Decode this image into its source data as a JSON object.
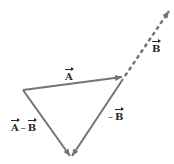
{
  "diagram": {
    "colors": {
      "line": "#737373",
      "label": "#2a2a2a",
      "background": "#ffffff"
    },
    "vectors": [
      {
        "name": "A",
        "style": "solid",
        "from": [
          23,
          90
        ],
        "to": [
          123,
          77
        ]
      },
      {
        "name": "B",
        "style": "dashed",
        "from": [
          125,
          76
        ],
        "to": [
          170,
          10
        ]
      },
      {
        "name": "-B",
        "style": "solid",
        "from": [
          123,
          79
        ],
        "to": [
          72,
          156
        ]
      },
      {
        "name": "A-B",
        "style": "solid",
        "from": [
          23,
          90
        ],
        "to": [
          70,
          156
        ]
      }
    ],
    "labels": {
      "A": {
        "symbol": "A"
      },
      "B": {
        "symbol": "B"
      },
      "neg_B": {
        "sign": "–",
        "symbol": "B"
      },
      "A_minus_B": {
        "left": "A",
        "op": "–",
        "right": "B"
      }
    }
  }
}
